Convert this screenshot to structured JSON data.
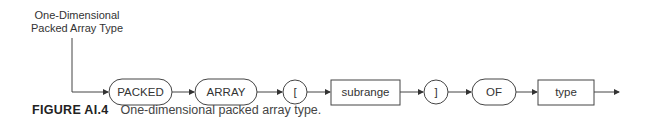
{
  "diagram": {
    "entry_label": [
      "One-Dimensional",
      "Packed Array Type"
    ],
    "nodes": [
      {
        "id": "packed",
        "shape": "rounded",
        "label": "PACKED"
      },
      {
        "id": "array",
        "shape": "rounded",
        "label": "ARRAY"
      },
      {
        "id": "lbracket",
        "shape": "circle",
        "label": "["
      },
      {
        "id": "subrange",
        "shape": "rect",
        "label": "subrange"
      },
      {
        "id": "rbracket",
        "shape": "circle",
        "label": "]"
      },
      {
        "id": "of",
        "shape": "rounded",
        "label": "OF"
      },
      {
        "id": "type",
        "shape": "rect",
        "label": "type"
      }
    ],
    "edges": [
      [
        "entry",
        "packed"
      ],
      [
        "packed",
        "array"
      ],
      [
        "array",
        "lbracket"
      ],
      [
        "lbracket",
        "subrange"
      ],
      [
        "subrange",
        "rbracket"
      ],
      [
        "rbracket",
        "of"
      ],
      [
        "of",
        "type"
      ],
      [
        "type",
        "exit"
      ]
    ]
  },
  "caption": {
    "figure": "FIGURE AI.4",
    "text": "One-dimensional packed array type."
  }
}
